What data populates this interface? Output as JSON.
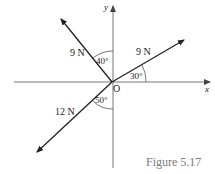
{
  "figure": {
    "caption": "Figure 5.17",
    "origin_label": "O",
    "x_axis_label": "x",
    "y_axis_label": "y"
  },
  "forces": [
    {
      "name": "force-upper-left",
      "magnitude_label": "9 N",
      "angle_label": "40°",
      "angle_reference": "from +y axis toward -x"
    },
    {
      "name": "force-upper-right",
      "magnitude_label": "9 N",
      "angle_label": "30°",
      "angle_reference": "from +x axis toward +y"
    },
    {
      "name": "force-lower-left",
      "magnitude_label": "12 N",
      "angle_label": "50°",
      "angle_reference": "from -y axis toward -x"
    }
  ],
  "colors": {
    "axis": "#555555",
    "vector": "#222222",
    "caption": "#7a7a7a"
  }
}
